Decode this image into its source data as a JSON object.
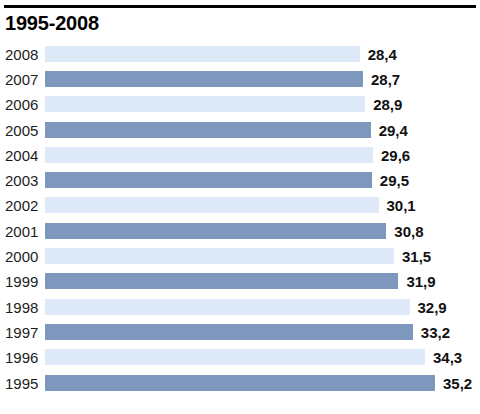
{
  "title": "1995-2008",
  "colors": {
    "bar_light": "#dde9f6",
    "bar_dark": "#7d97bd",
    "rule": "#000000",
    "text": "#1a1a1a",
    "background": "#ffffff"
  },
  "chart_data": {
    "type": "bar",
    "orientation": "horizontal",
    "title": "1995-2008",
    "xlabel": "",
    "ylabel": "",
    "grid": false,
    "legend": false,
    "decimal_separator": ",",
    "axis_visible": false,
    "categories": [
      "2008",
      "2007",
      "2006",
      "2005",
      "2004",
      "2003",
      "2002",
      "2001",
      "2000",
      "1999",
      "1998",
      "1997",
      "1996",
      "1995"
    ],
    "values": [
      28.4,
      28.7,
      28.9,
      29.4,
      29.6,
      29.5,
      30.1,
      30.8,
      31.5,
      31.9,
      32.9,
      33.2,
      34.3,
      35.2
    ],
    "value_labels": [
      "28,4",
      "28,7",
      "28,9",
      "29,4",
      "29,6",
      "29,5",
      "30,1",
      "30,8",
      "31,5",
      "31,9",
      "32,9",
      "33,2",
      "34,3",
      "35,2"
    ],
    "bar_colors": [
      "light",
      "dark",
      "light",
      "dark",
      "light",
      "dark",
      "light",
      "dark",
      "light",
      "dark",
      "light",
      "dark",
      "light",
      "dark"
    ],
    "xlim": [
      0,
      35.2
    ]
  },
  "rows": [
    {
      "year": "2008",
      "value": "28,4",
      "num": 28.4,
      "shade": "light"
    },
    {
      "year": "2007",
      "value": "28,7",
      "num": 28.7,
      "shade": "dark"
    },
    {
      "year": "2006",
      "value": "28,9",
      "num": 28.9,
      "shade": "light"
    },
    {
      "year": "2005",
      "value": "29,4",
      "num": 29.4,
      "shade": "dark"
    },
    {
      "year": "2004",
      "value": "29,6",
      "num": 29.6,
      "shade": "light"
    },
    {
      "year": "2003",
      "value": "29,5",
      "num": 29.5,
      "shade": "dark"
    },
    {
      "year": "2002",
      "value": "30,1",
      "num": 30.1,
      "shade": "light"
    },
    {
      "year": "2001",
      "value": "30,8",
      "num": 30.8,
      "shade": "dark"
    },
    {
      "year": "2000",
      "value": "31,5",
      "num": 31.5,
      "shade": "light"
    },
    {
      "year": "1999",
      "value": "31,9",
      "num": 31.9,
      "shade": "dark"
    },
    {
      "year": "1998",
      "value": "32,9",
      "num": 32.9,
      "shade": "light"
    },
    {
      "year": "1997",
      "value": "33,2",
      "num": 33.2,
      "shade": "dark"
    },
    {
      "year": "1996",
      "value": "34,3",
      "num": 34.3,
      "shade": "light"
    },
    {
      "year": "1995",
      "value": "35,2",
      "num": 35.2,
      "shade": "dark"
    }
  ]
}
